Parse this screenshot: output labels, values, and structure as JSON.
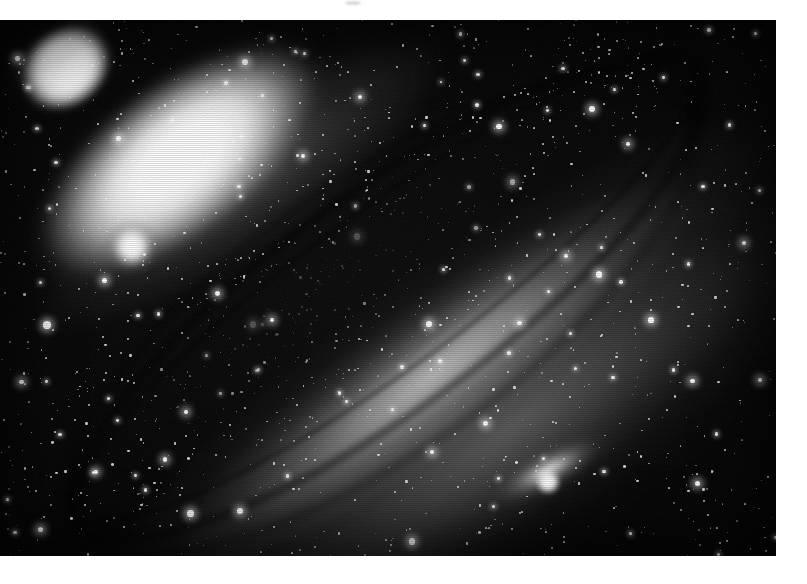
{
  "page": {
    "background_color": "#ffffff",
    "caption_remnant": {
      "visible_glyphs": "”",
      "note": "bottom tips of a closing double quotation mark clipped by the top edge"
    }
  },
  "photo": {
    "title": "Andromeda Galaxy (M31) with satellites M32 and NGC 205",
    "kind": "astrophotograph",
    "color_mode": "black-and-white",
    "frame": {
      "x": 0,
      "y": 20,
      "width": 776,
      "height": 536
    },
    "background_color": "#000000",
    "highlight_color": "#ffffff",
    "objects": [
      {
        "name": "M31",
        "label": "Andromeda Galaxy core and disc",
        "type": "spiral-galaxy",
        "center_pct": {
          "x": 43,
          "y": 49
        },
        "position_angle_deg": -36,
        "features": [
          "bright nucleus",
          "elliptical bulge",
          "inclined disc",
          "dark dust lanes",
          "outer spiral arms"
        ]
      },
      {
        "name": "M32",
        "label": "M32 compact elliptical satellite",
        "type": "elliptical-galaxy",
        "center_pct": {
          "x": 17,
          "y": 45
        }
      },
      {
        "name": "NGC 205",
        "label": "NGC 205 (M110) dwarf elliptical satellite",
        "type": "elliptical-galaxy",
        "center_pct": {
          "x": 71,
          "y": 87
        }
      },
      {
        "name": "foreground-star",
        "label": "bright foreground star",
        "type": "star",
        "center_pct": {
          "x": 6,
          "y": 57
        }
      }
    ],
    "texture": {
      "halftone_scanlines": true,
      "film_grain": true
    }
  }
}
